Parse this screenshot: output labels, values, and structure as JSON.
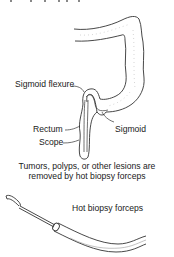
{
  "diagram": {
    "top_cutoff_text": "Tumors, polyps, or other lesions",
    "labels": {
      "sigmoid_flexure": "Sigmoid flexure",
      "rectum": "Rectum",
      "scope": "Scope",
      "sigmoid": "Sigmoid"
    },
    "caption_line1": "Tumors, polyps, or other lesions are",
    "caption_line2": "removed by hot biopsy forceps",
    "forceps_label": "Hot biopsy forceps"
  },
  "colors": {
    "line": "#333333",
    "stipple": "#bbbbbb",
    "background": "#ffffff"
  }
}
